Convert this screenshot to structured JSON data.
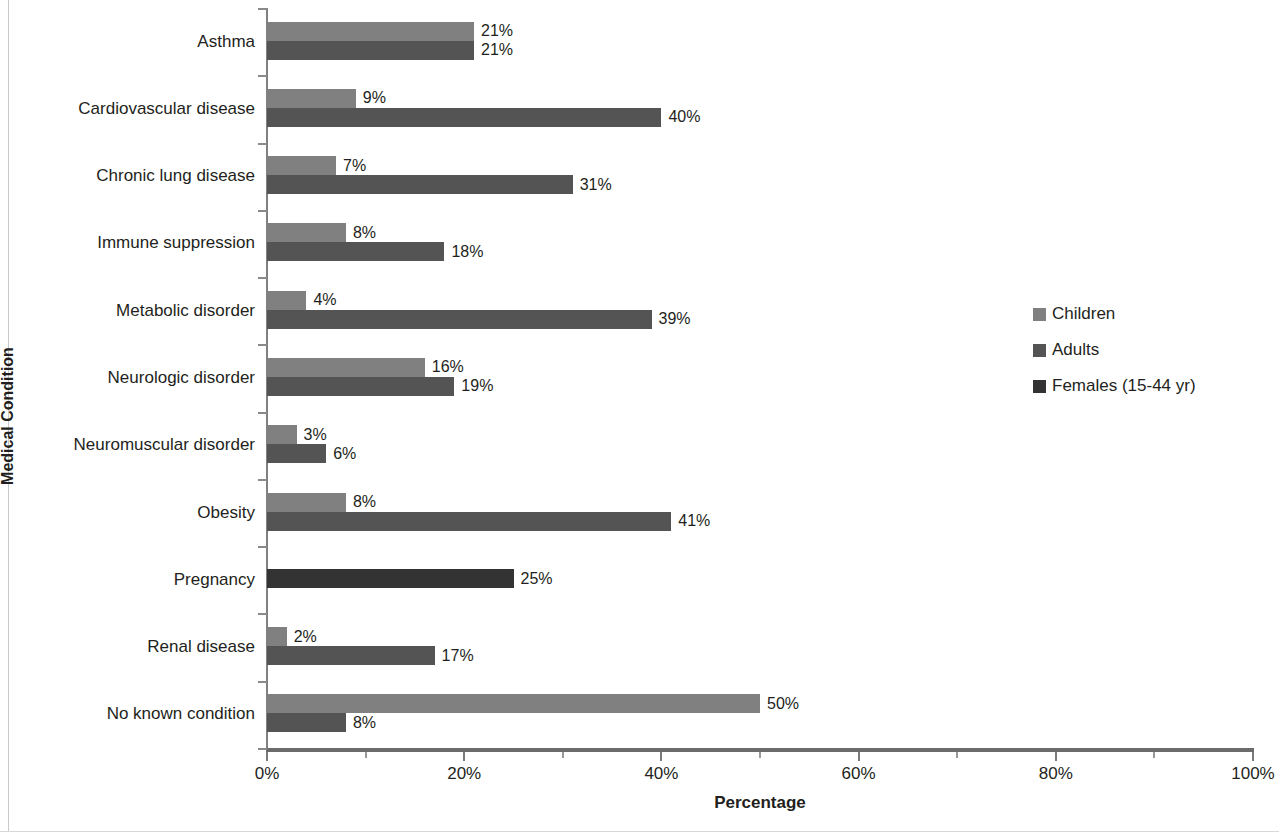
{
  "chart_data": {
    "type": "bar",
    "orientation": "horizontal",
    "title": "",
    "xlabel": "Percentage",
    "ylabel": "Medical Condition",
    "xlim": [
      0,
      100
    ],
    "xticks": [
      "0%",
      "20%",
      "40%",
      "60%",
      "80%",
      "100%"
    ],
    "xtick_values": [
      0,
      20,
      40,
      60,
      80,
      100
    ],
    "minor_xtick_values": [
      10,
      30,
      50,
      70,
      90
    ],
    "grid": false,
    "legend_position": "right",
    "value_label_suffix": "%",
    "categories": [
      "Asthma",
      "Cardiovascular disease",
      "Chronic lung disease",
      "Immune suppression",
      "Metabolic disorder",
      "Neurologic disorder",
      "Neuromuscular disorder",
      "Obesity",
      "Pregnancy",
      "Renal disease",
      "No known condition"
    ],
    "series": [
      {
        "name": "Children",
        "color": "#808080",
        "values": [
          21,
          9,
          7,
          8,
          4,
          16,
          3,
          8,
          null,
          2,
          50
        ],
        "labels": [
          "21%",
          "9%",
          "7%",
          "8%",
          "4%",
          "16%",
          "3%",
          "8%",
          "",
          "2%",
          "50%"
        ]
      },
      {
        "name": "Adults",
        "color": "#545454",
        "values": [
          21,
          40,
          31,
          18,
          39,
          19,
          6,
          41,
          null,
          17,
          8
        ],
        "labels": [
          "21%",
          "40%",
          "31%",
          "18%",
          "39%",
          "19%",
          "6%",
          "41%",
          "",
          "17%",
          "8%"
        ]
      },
      {
        "name": "Females (15-44 yr)",
        "color": "#333333",
        "values": [
          null,
          null,
          null,
          null,
          null,
          null,
          null,
          null,
          25,
          null,
          null
        ],
        "labels": [
          "",
          "",
          "",
          "",
          "",
          "",
          "",
          "",
          "25%",
          "",
          ""
        ]
      }
    ]
  },
  "legend": {
    "items": [
      {
        "label": "Children",
        "color": "#808080"
      },
      {
        "label": "Adults",
        "color": "#545454"
      },
      {
        "label": "Females (15-44 yr)",
        "color": "#333333"
      }
    ]
  },
  "axes": {
    "x_title": "Percentage",
    "y_title": "Medical Condition"
  }
}
